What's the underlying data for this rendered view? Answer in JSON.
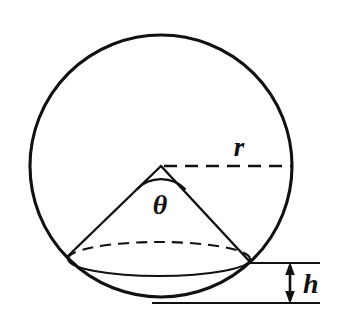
{
  "figure": {
    "background_color": "#ffffff",
    "stroke_color": "#111111",
    "width": 338,
    "height": 330
  },
  "labels": {
    "radius": "r",
    "angle": "θ",
    "height": "h"
  },
  "geometry": {
    "circle": {
      "name": "outer-circle",
      "center_x": 161,
      "center_y": 166,
      "radius": 131,
      "style": "solid"
    },
    "cone_apex": {
      "x": 161,
      "y": 166
    },
    "cone_base_ellipse": {
      "center_x": 159,
      "center_y": 259,
      "rx": 91,
      "ry": 17,
      "back_half_style": "dashed",
      "front_half_style": "solid"
    },
    "cone_left_edge": {
      "x1": 161,
      "y1": 166,
      "x2": 68,
      "y2": 256
    },
    "cone_right_edge": {
      "x1": 161,
      "y1": 166,
      "x2": 250,
      "y2": 262
    },
    "radius_line": {
      "x1": 163,
      "y1": 166,
      "x2": 292,
      "y2": 166,
      "style": "dashed"
    },
    "angle_arc": {
      "center_x": 161,
      "center_y": 166,
      "arc_radius": 34,
      "start_deg": 136,
      "end_deg": 44
    },
    "upper_reference_line": {
      "x1": 248,
      "y1": 263,
      "x2": 320,
      "y2": 263
    },
    "lower_reference_line": {
      "x1": 155,
      "y1": 303,
      "x2": 320,
      "y2": 303
    },
    "height_arrow": {
      "x": 290,
      "y_top": 263,
      "y_bottom": 303,
      "double_headed": true
    }
  },
  "label_positions": {
    "radius": {
      "x": 239,
      "y": 156
    },
    "angle": {
      "x": 160,
      "y": 213
    },
    "height": {
      "x": 303,
      "y": 292
    }
  }
}
